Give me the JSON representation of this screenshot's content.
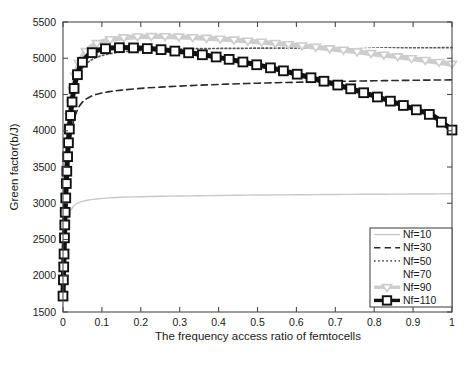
{
  "chart_data": {
    "type": "line",
    "title": "",
    "xlabel": "The frequency access ratio of femtocells",
    "ylabel": "Green factor(b/J)",
    "xlim": [
      0,
      1
    ],
    "ylim": [
      1500,
      5500
    ],
    "grid": false,
    "legend_position": "lower right",
    "xticks": [
      "0",
      "0.1",
      "0.2",
      "0.3",
      "0.4",
      "0.5",
      "0.6",
      "0.7",
      "0.8",
      "0.9",
      "1"
    ],
    "xtick_values": [
      0,
      0.1,
      0.2,
      0.3,
      0.4,
      0.5,
      0.6,
      0.7,
      0.8,
      0.9,
      1
    ],
    "yticks": [
      "1500",
      "2000",
      "2500",
      "3000",
      "3500",
      "4000",
      "4500",
      "5000",
      "5500"
    ],
    "ytick_values": [
      1500,
      2000,
      2500,
      3000,
      3500,
      4000,
      4500,
      5000,
      5500
    ],
    "x": [
      0,
      0.005,
      0.01,
      0.015,
      0.02,
      0.025,
      0.03,
      0.04,
      0.05,
      0.06,
      0.07,
      0.08,
      0.09,
      0.1,
      0.12,
      0.15,
      0.2,
      0.25,
      0.3,
      0.35,
      0.4,
      0.45,
      0.5,
      0.55,
      0.6,
      0.65,
      0.7,
      0.75,
      0.8,
      0.85,
      0.9,
      0.95,
      1
    ],
    "series": [
      {
        "name": "Nf=10",
        "label": "Nf=10",
        "color": "#c9c9c9",
        "style": "solid",
        "width": 1.4,
        "marker": "none",
        "values": [
          1720,
          2300,
          2650,
          2820,
          2900,
          2945,
          2975,
          3005,
          3025,
          3038,
          3048,
          3055,
          3062,
          3067,
          3074,
          3082,
          3090,
          3096,
          3100,
          3104,
          3107,
          3110,
          3113,
          3115,
          3117,
          3119,
          3121,
          3123,
          3124,
          3126,
          3127,
          3128,
          3130
        ]
      },
      {
        "name": "Nf=30",
        "label": "Nf=30",
        "color": "#2b2b2b",
        "style": "dashed",
        "width": 1.6,
        "marker": "none",
        "values": [
          1720,
          2700,
          3300,
          3680,
          3920,
          4080,
          4190,
          4320,
          4395,
          4440,
          4470,
          4492,
          4508,
          4520,
          4540,
          4560,
          4585,
          4602,
          4616,
          4628,
          4639,
          4648,
          4656,
          4663,
          4669,
          4675,
          4680,
          4685,
          4689,
          4693,
          4696,
          4699,
          4702
        ]
      },
      {
        "name": "Nf=50",
        "label": "Nf=50",
        "color": "#5a5a5a",
        "style": "dotted",
        "width": 1.7,
        "marker": "none",
        "values": [
          1720,
          2800,
          3480,
          3930,
          4230,
          4435,
          4580,
          4760,
          4862,
          4925,
          4968,
          4998,
          5020,
          5037,
          5062,
          5086,
          5108,
          5120,
          5127,
          5132,
          5135,
          5137,
          5139,
          5140,
          5141,
          5142,
          5143,
          5143,
          5144,
          5144,
          5145,
          5145,
          5146
        ]
      },
      {
        "name": "Nf=70",
        "label": "Nf=70",
        "color": "#fdfdfd",
        "style": "solid",
        "width": 1.4,
        "marker": "none",
        "values": [
          1720,
          2820,
          3520,
          3985,
          4295,
          4510,
          4660,
          4850,
          4958,
          5025,
          5070,
          5102,
          5125,
          5143,
          5168,
          5192,
          5210,
          5215,
          5214,
          5210,
          5204,
          5197,
          5189,
          5181,
          5172,
          5163,
          5154,
          5145,
          5136,
          5127,
          5118,
          5109,
          5100
        ]
      },
      {
        "name": "Nf=90",
        "label": "Nf=90",
        "color": "#cdcdcd",
        "style": "solid",
        "width": 5.0,
        "marker": "triangle-down",
        "values": [
          1720,
          2830,
          3545,
          4020,
          4340,
          4560,
          4718,
          4915,
          5030,
          5102,
          5150,
          5185,
          5210,
          5228,
          5255,
          5280,
          5298,
          5300,
          5293,
          5281,
          5265,
          5247,
          5226,
          5203,
          5178,
          5151,
          5122,
          5092,
          5060,
          5027,
          4992,
          4956,
          4918
        ]
      },
      {
        "name": "Nf=110",
        "label": "Nf=110",
        "color": "#111111",
        "style": "solid",
        "width": 5.0,
        "marker": "square",
        "values": [
          1720,
          2790,
          3470,
          3930,
          4250,
          4470,
          4630,
          4832,
          4945,
          5015,
          5062,
          5092,
          5112,
          5125,
          5140,
          5147,
          5140,
          5120,
          5092,
          5055,
          5012,
          4962,
          4908,
          4848,
          4783,
          4714,
          4640,
          4562,
          4480,
          4394,
          4304,
          4210,
          4010
        ]
      }
    ]
  }
}
